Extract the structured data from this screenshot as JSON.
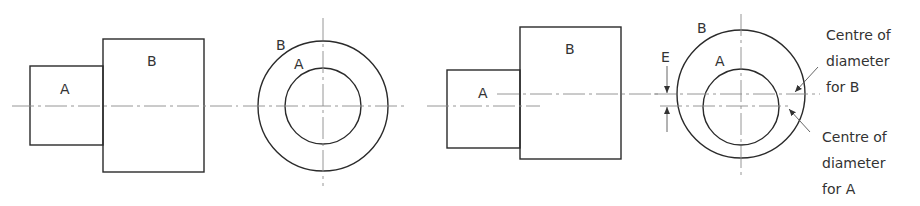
{
  "figure": {
    "left_side_view": {
      "label_a": "A",
      "label_b": "B"
    },
    "left_end_view": {
      "label_a": "A",
      "label_b": "B"
    },
    "right_side_view": {
      "label_a": "A",
      "label_b": "B"
    },
    "right_end_view": {
      "label_a": "A",
      "label_b": "B",
      "label_e": "E",
      "note_b": [
        "Centre of",
        "diameter",
        "for B"
      ],
      "note_a": [
        "Centre of",
        "diameter",
        "for A"
      ]
    },
    "colors": {
      "outline": "#2a2a2a",
      "centerline": "#8a8a8a",
      "text": "#333333"
    }
  }
}
